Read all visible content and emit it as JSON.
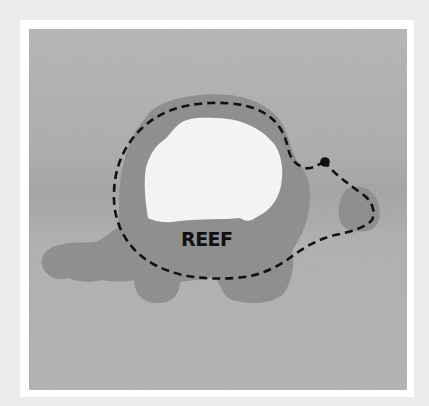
{
  "map": {
    "label": "REEF",
    "colors": {
      "page_background": "#ebebeb",
      "frame": "#ffffff",
      "water": "#b3b3b3",
      "water_band": "#a9a9a9",
      "reef": "#8f8f8f",
      "lagoon": "#f4f4f4",
      "route": "#111111",
      "start_marker": "#111111"
    },
    "features": [
      {
        "type": "reef",
        "description": "turtle-shaped reef mass"
      },
      {
        "type": "lagoon",
        "description": "white open area inside reef"
      },
      {
        "type": "reef-patch",
        "description": "small isolated reef to the east"
      },
      {
        "type": "route",
        "style": "dashed",
        "description": "dashed loop around reef starting at marker"
      },
      {
        "type": "marker",
        "description": "black start point dot"
      }
    ]
  }
}
